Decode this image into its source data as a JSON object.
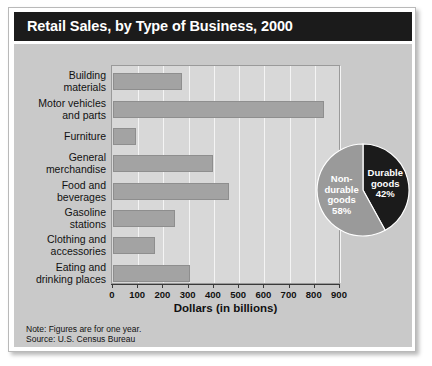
{
  "figure": {
    "title": "Retail Sales, by Type of Business, 2000",
    "note": "Note: Figures are for one year.",
    "source": "Source:  U.S. Census Bureau",
    "colors": {
      "title_band": "#1b1b1b",
      "panel": "#c9c9c9",
      "plot": "#d8d8d8",
      "bar": "#a3a3a3",
      "pie_durable": "#1b1b1b",
      "pie_nondurable": "#9a9a9a",
      "gridline": "#f4f4f4"
    }
  },
  "chart_data": [
    {
      "type": "bar",
      "orientation": "horizontal",
      "title": "Retail Sales, by Type of Business, 2000",
      "xlabel": "Dollars (in billions)",
      "ylabel": "",
      "xlim": [
        0,
        900
      ],
      "xticks": [
        0,
        100,
        200,
        300,
        400,
        500,
        600,
        700,
        800,
        900
      ],
      "xtick_labels": [
        "0",
        "100",
        "200",
        "300",
        "400",
        "500",
        "600",
        "700",
        "800",
        "900"
      ],
      "grid": true,
      "legend": "none",
      "categories": [
        "Building\nmaterials",
        "Motor vehicles\nand parts",
        "Furniture",
        "General\nmerchandise",
        "Food and\nbeverages",
        "Gasoline\nstations",
        "Clothing and\naccessories",
        "Eating and\ndrinking places"
      ],
      "values": [
        275,
        835,
        90,
        395,
        460,
        245,
        165,
        305
      ]
    },
    {
      "type": "pie",
      "title": "",
      "labels": [
        "Durable goods",
        "Non-durable goods"
      ],
      "display_labels": [
        "Durable\ngoods\n42%",
        "Non-\ndurable\ngoods\n58%"
      ],
      "values": [
        42,
        58
      ],
      "unit": "%",
      "colors": [
        "#1b1b1b",
        "#9a9a9a"
      ],
      "start_angle_deg": 0,
      "direction": "clockwise",
      "legend": "none"
    }
  ]
}
